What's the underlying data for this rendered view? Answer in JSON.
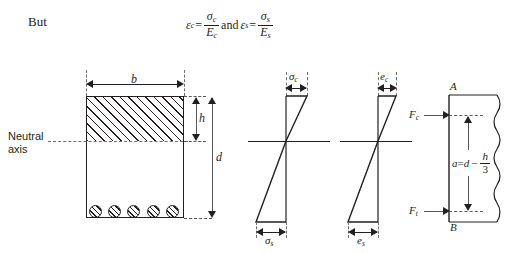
{
  "text": {
    "but": "But",
    "neutral_axis_line1": "Neutral",
    "neutral_axis_line2": "axis"
  },
  "equation": {
    "strain_c_symbol": "ε",
    "strain_c_sub": "c",
    "equals": "=",
    "stress_c_symbol": "σ",
    "stress_c_sub": "c",
    "modulus_c_symbol": "E",
    "modulus_c_sub": "c",
    "and": "and",
    "strain_s_symbol": "ε",
    "strain_s_sub": "s",
    "stress_s_symbol": "σ",
    "stress_s_sub": "s",
    "modulus_s_symbol": "E",
    "modulus_s_sub": "s"
  },
  "cross_section": {
    "width_label": "b",
    "compression_depth_label": "h",
    "effective_depth_label": "d",
    "rebar_count": 5
  },
  "stress_diagram": {
    "top_label": "σ",
    "top_sub": "c",
    "bottom_label": "σ",
    "bottom_sub": "s"
  },
  "strain_diagram": {
    "top_label": "e",
    "top_sub": "c",
    "bottom_label": "e",
    "bottom_sub": "s"
  },
  "force_diagram": {
    "point_top": "A",
    "point_bottom": "B",
    "force_compression": "F",
    "force_compression_sub": "c",
    "force_tension": "F",
    "force_tension_sub": "t",
    "lever_arm_a": "a",
    "lever_arm_equals": "=",
    "lever_arm_d": "d",
    "lever_arm_minus": "−",
    "lever_arm_num": "h",
    "lever_arm_den": "3"
  },
  "colors": {
    "ink": "#231f20",
    "gray": "#58585b",
    "background": "#ffffff"
  }
}
